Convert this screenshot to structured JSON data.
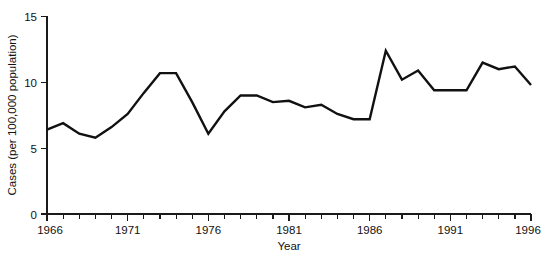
{
  "chart_data": {
    "type": "line",
    "title": "",
    "subtitle": "",
    "xlabel": "Year",
    "ylabel": "Cases (per 100,000 population)",
    "xlim": [
      1966,
      1996
    ],
    "ylim": [
      0,
      15
    ],
    "grid": false,
    "legend": null,
    "legend_position": "none",
    "y_ticks": [
      0,
      5,
      10,
      15
    ],
    "y_tick_labels": [
      "0",
      "5",
      "10",
      "15"
    ],
    "x_ticks": [
      1966,
      1967,
      1968,
      1969,
      1970,
      1971,
      1972,
      1973,
      1974,
      1975,
      1976,
      1977,
      1978,
      1979,
      1980,
      1981,
      1982,
      1983,
      1984,
      1985,
      1986,
      1987,
      1988,
      1989,
      1990,
      1991,
      1992,
      1993,
      1994,
      1995,
      1996
    ],
    "x_tick_labels_shown": [
      "1966",
      "1971",
      "1976",
      "1981",
      "1986",
      "1991",
      "1996"
    ],
    "x_labeled_ticks": [
      1966,
      1971,
      1976,
      1981,
      1986,
      1991,
      1996
    ],
    "line_color": "#111111",
    "x": [
      1966,
      1967,
      1968,
      1969,
      1970,
      1971,
      1972,
      1973,
      1974,
      1975,
      1976,
      1977,
      1978,
      1979,
      1980,
      1981,
      1982,
      1983,
      1984,
      1985,
      1986,
      1987,
      1988,
      1989,
      1990,
      1991,
      1992,
      1993,
      1994,
      1995,
      1996
    ],
    "values": [
      6.4,
      6.9,
      6.1,
      5.8,
      6.6,
      7.6,
      9.2,
      10.7,
      10.7,
      8.5,
      6.1,
      7.8,
      9.0,
      9.0,
      8.5,
      8.6,
      8.1,
      8.3,
      7.6,
      7.2,
      7.2,
      12.4,
      10.2,
      10.9,
      9.4,
      9.4,
      9.4,
      11.5,
      11.0,
      11.2,
      9.8
    ],
    "series": [
      {
        "name": "Cases per 100,000 population",
        "values": [
          6.4,
          6.9,
          6.1,
          5.8,
          6.6,
          7.6,
          9.2,
          10.7,
          10.7,
          8.5,
          6.1,
          7.8,
          9.0,
          9.0,
          8.5,
          8.6,
          8.1,
          8.3,
          7.6,
          7.2,
          7.2,
          12.4,
          10.2,
          10.9,
          9.4,
          9.4,
          9.4,
          11.5,
          11.0,
          11.2,
          9.8
        ]
      }
    ]
  },
  "axes": {
    "y_title": "Cases (per 100,000 population)",
    "x_title": "Year",
    "y_labels": [
      "15",
      "10",
      "5",
      "0"
    ],
    "x_labels": [
      "1966",
      "1971",
      "1976",
      "1981",
      "1986",
      "1991",
      "1996"
    ]
  }
}
